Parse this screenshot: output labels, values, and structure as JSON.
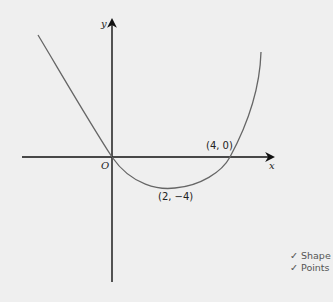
{
  "diagram": {
    "type": "cubic_sketch",
    "axes": {
      "x_label": "x",
      "y_label": "y",
      "origin_label": "O"
    },
    "points": [
      {
        "label": "(4, 0)",
        "role": "x-intercept"
      },
      {
        "label": "(2, −4)",
        "role": "turning-point"
      }
    ],
    "colors": {
      "background": "#efefef",
      "axis": "#111111",
      "curve": "#666666"
    }
  },
  "marks": [
    {
      "icon": "check-icon",
      "glyph": "✓",
      "text": "Shape"
    },
    {
      "icon": "check-icon",
      "glyph": "✓",
      "text": "Points"
    }
  ]
}
